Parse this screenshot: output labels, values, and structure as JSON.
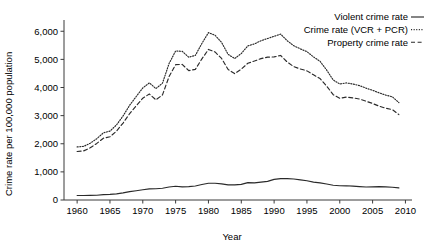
{
  "chart_data": {
    "type": "line",
    "title": "",
    "xlabel": "Year",
    "ylabel": "Crime rate per 100,000 population",
    "xlim": [
      1958,
      2011
    ],
    "ylim": [
      0,
      6400
    ],
    "grid": false,
    "legend_position": "top-right",
    "x_ticks": [
      "1960",
      "1965",
      "1970",
      "1975",
      "1980",
      "1985",
      "1990",
      "1995",
      "2000",
      "2005",
      "2010"
    ],
    "x_tick_values": [
      1960,
      1965,
      1970,
      1975,
      1980,
      1985,
      1990,
      1995,
      2000,
      2005,
      2010
    ],
    "y_ticks": [
      "0",
      "1,000",
      "2,000",
      "3,000",
      "4,000",
      "5,000",
      "6,000"
    ],
    "y_tick_values": [
      0,
      1000,
      2000,
      3000,
      4000,
      5000,
      6000
    ],
    "x": [
      1960,
      1961,
      1962,
      1963,
      1964,
      1965,
      1966,
      1967,
      1968,
      1969,
      1970,
      1971,
      1972,
      1973,
      1974,
      1975,
      1976,
      1977,
      1978,
      1979,
      1980,
      1981,
      1982,
      1983,
      1984,
      1985,
      1986,
      1987,
      1988,
      1989,
      1990,
      1991,
      1992,
      1993,
      1994,
      1995,
      1996,
      1997,
      1998,
      1999,
      2000,
      2001,
      2002,
      2003,
      2004,
      2005,
      2006,
      2007,
      2008,
      2009
    ],
    "series": [
      {
        "name": "Crime rate (VCR + PCR)",
        "style": "dotted",
        "values": [
          1887,
          1906,
          2019,
          2180,
          2388,
          2449,
          2670,
          2989,
          3370,
          3680,
          3984,
          4164,
          3961,
          4154,
          4850,
          5298,
          5287,
          5077,
          5140,
          5565,
          5950,
          5858,
          5604,
          5175,
          5031,
          5207,
          5480,
          5550,
          5664,
          5741,
          5820,
          5898,
          5660,
          5484,
          5373,
          5274,
          5087,
          4930,
          4620,
          4267,
          4124,
          4163,
          4125,
          4067,
          3977,
          3901,
          3808,
          3730,
          3669,
          3466
        ]
      },
      {
        "name": "Property crime rate",
        "style": "dashed",
        "values": [
          1726,
          1747,
          1857,
          2012,
          2198,
          2249,
          2451,
          2736,
          3071,
          3351,
          3621,
          3769,
          3561,
          3737,
          4389,
          4811,
          4820,
          4602,
          4643,
          5017,
          5353,
          5264,
          5033,
          4637,
          4492,
          4651,
          4863,
          4940,
          5027,
          5078,
          5088,
          5140,
          4903,
          4740,
          4660,
          4591,
          4451,
          4316,
          4053,
          3744,
          3618,
          3658,
          3631,
          3591,
          3514,
          3432,
          3335,
          3264,
          3215,
          3036
        ]
      },
      {
        "name": "Violent crime rate",
        "style": "solid",
        "values": [
          161,
          159,
          162,
          168,
          190,
          200,
          220,
          253,
          298,
          329,
          364,
          396,
          401,
          417,
          461,
          488,
          468,
          476,
          498,
          549,
          597,
          594,
          571,
          538,
          539,
          556,
          618,
          610,
          637,
          663,
          732,
          758,
          758,
          747,
          714,
          685,
          637,
          611,
          568,
          523,
          506,
          505,
          494,
          476,
          463,
          469,
          474,
          467,
          455,
          429
        ]
      }
    ],
    "legend": [
      {
        "label": "Violent crime rate",
        "style": "solid"
      },
      {
        "label": "Crime rate (VCR + PCR)",
        "style": "dotted"
      },
      {
        "label": "Property crime rate",
        "style": "dashed"
      }
    ],
    "colors": {
      "line": "#2a2a2a",
      "axis": "#3b3b3b",
      "background": "#ffffff",
      "text": "#000000"
    }
  }
}
